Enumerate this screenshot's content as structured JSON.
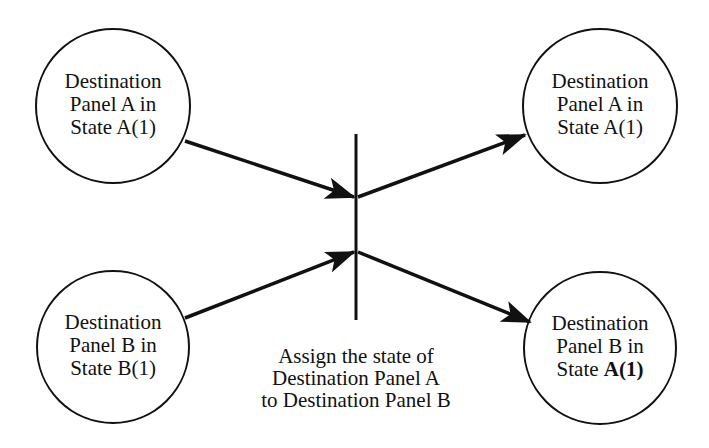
{
  "nodes": {
    "top_left": {
      "line1": "Destination",
      "line2": "Panel A in",
      "line3_prefix": "State ",
      "line3_state": "A(1)"
    },
    "bottom_left": {
      "line1": "Destination",
      "line2": "Panel B in",
      "line3_prefix": "State ",
      "line3_state": "B(1)"
    },
    "top_right": {
      "line1": "Destination",
      "line2": "Panel A in",
      "line3_prefix": "State ",
      "line3_state": "A(1)"
    },
    "bottom_right": {
      "line1": "Destination",
      "line2": "Panel B in",
      "line3_prefix": "State ",
      "line3_state": "A(1)"
    }
  },
  "transition": {
    "caption_line1": "Assign the state of",
    "caption_line2": "Destination Panel A",
    "caption_line3": "to Destination Panel B"
  },
  "colors": {
    "stroke": "#111111",
    "background": "#ffffff"
  }
}
